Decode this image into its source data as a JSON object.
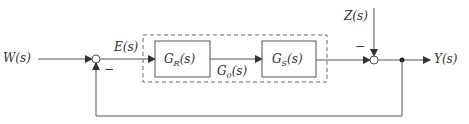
{
  "diagram": {
    "type": "control-loop-block-diagram",
    "signals": {
      "input": "W(s)",
      "error": "E(s)",
      "disturbance": "Z(s)",
      "output": "Y(s)"
    },
    "blocks": [
      {
        "id": "controller",
        "name": "G",
        "sub": "R",
        "arg": "(s)"
      },
      {
        "id": "plant",
        "name": "G",
        "sub": "S",
        "arg": "(s)"
      }
    ],
    "group": {
      "name": "G",
      "sub": "0",
      "arg": "(s)",
      "style": "dashed"
    },
    "summing_junctions": [
      {
        "id": "sum1",
        "minus_sign": "−"
      },
      {
        "id": "sum2",
        "minus_sign": "−"
      }
    ],
    "colors": {
      "line": "#555555",
      "text": "#333333"
    }
  }
}
